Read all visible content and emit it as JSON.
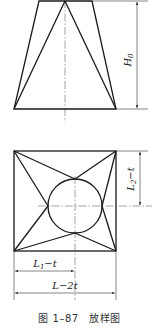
{
  "figure": {
    "caption": "图 1–87　放样图",
    "elevation_view": {
      "description": "truncated pyramid elevation with triangulation lines",
      "dimension_labels": {
        "height": "H",
        "height_sub": "0"
      }
    },
    "plan_view": {
      "description": "square base with inscribed circle and triangulation lines",
      "dimension_labels": {
        "half_width_vertical": "L",
        "half_width_vertical_sub": "2",
        "half_width_vertical_suffix": "−t",
        "half_width_horizontal": "L",
        "half_width_horizontal_sub": "1",
        "half_width_horizontal_suffix": "−t",
        "full_width": "L−2t"
      }
    }
  }
}
